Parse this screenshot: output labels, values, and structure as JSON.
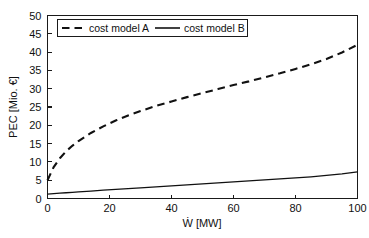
{
  "chart_data": {
    "type": "line",
    "title": "",
    "xlabel": "Ẇ [MW]",
    "ylabel": "PEC [Mio. €]",
    "xlim": [
      0,
      100
    ],
    "ylim": [
      0,
      50
    ],
    "xticks": [
      0,
      20,
      40,
      60,
      80,
      100
    ],
    "xtick_labels": [
      "0",
      "20",
      "40",
      "60",
      "80",
      "100"
    ],
    "yticks": [
      0,
      5,
      10,
      15,
      20,
      25,
      30,
      35,
      40,
      45,
      50
    ],
    "ytick_labels": [
      "0",
      "5",
      "10",
      "15",
      "20",
      "25",
      "30",
      "35",
      "40",
      "45",
      "50"
    ],
    "grid": false,
    "legend_position": "upper-left-inside",
    "x": [
      0,
      2,
      4,
      6,
      8,
      10,
      14,
      18,
      22,
      26,
      30,
      35,
      40,
      45,
      50,
      55,
      60,
      65,
      70,
      75,
      80,
      85,
      90,
      95,
      100
    ],
    "series": [
      {
        "name": "cost model A",
        "style": "dashed",
        "color": "#111111",
        "values": [
          5.0,
          8.6,
          11.0,
          12.9,
          14.4,
          15.7,
          17.9,
          19.7,
          21.3,
          22.7,
          23.9,
          25.3,
          26.5,
          27.7,
          28.8,
          29.9,
          31.0,
          32.0,
          33.1,
          34.2,
          35.4,
          36.7,
          38.1,
          39.9,
          42.0
        ]
      },
      {
        "name": "cost model B",
        "style": "solid",
        "color": "#111111",
        "values": [
          1.2,
          1.33,
          1.45,
          1.57,
          1.69,
          1.81,
          2.04,
          2.27,
          2.49,
          2.71,
          2.93,
          3.2,
          3.47,
          3.74,
          4.0,
          4.27,
          4.54,
          4.81,
          5.08,
          5.35,
          5.63,
          5.92,
          6.3,
          6.75,
          7.3
        ]
      }
    ]
  },
  "legend": {
    "entry_a": "cost model A",
    "entry_b": "cost model B"
  },
  "axes": {
    "x_title": "Ẇ [MW]",
    "y_title": "PEC [Mio. €]"
  }
}
